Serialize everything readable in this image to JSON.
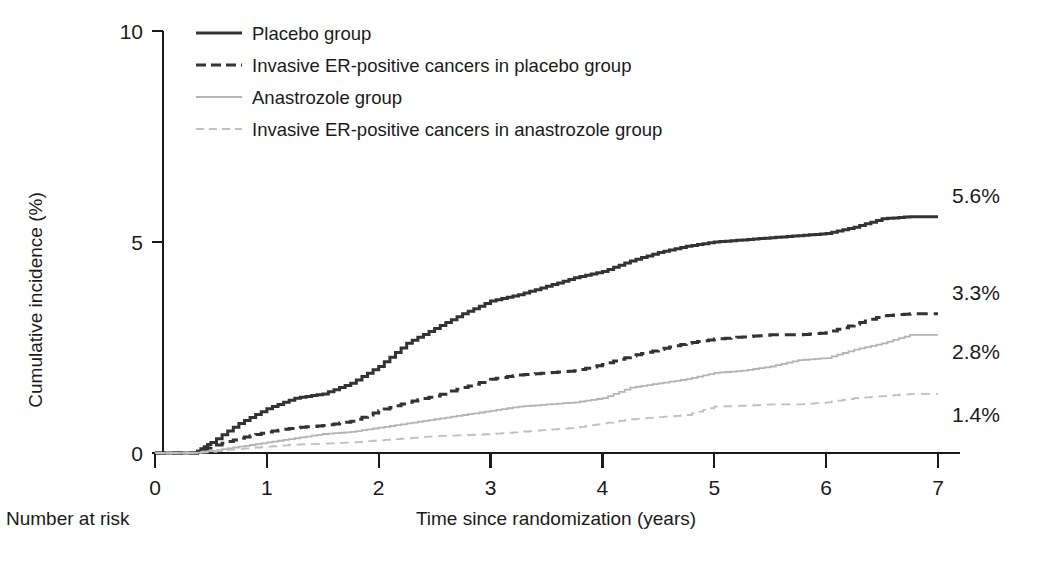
{
  "chart_data": {
    "type": "line",
    "title": "",
    "xlabel": "Time since randomization (years)",
    "ylabel": "Cumulative incidence (%)",
    "xlim": [
      0,
      7
    ],
    "ylim": [
      0,
      10
    ],
    "xticks": [
      "0",
      "1",
      "2",
      "3",
      "4",
      "5",
      "6",
      "7"
    ],
    "yticks": [
      "0",
      "5",
      "10"
    ],
    "grid": false,
    "legend_position": "top-left-inside",
    "x": [
      0,
      0.35,
      0.5,
      0.75,
      1,
      1.25,
      1.5,
      1.75,
      2,
      2.25,
      2.5,
      2.75,
      3,
      3.25,
      3.5,
      3.75,
      4,
      4.25,
      4.5,
      4.75,
      5,
      5.25,
      5.5,
      5.75,
      6,
      6.25,
      6.5,
      6.75,
      7
    ],
    "series": [
      {
        "name": "Placebo group",
        "style": "solid",
        "color": "#333333",
        "end_label": "5.6%",
        "values": [
          0,
          0.0,
          0.25,
          0.7,
          1.05,
          1.3,
          1.4,
          1.65,
          2.05,
          2.6,
          2.95,
          3.3,
          3.6,
          3.75,
          3.95,
          4.15,
          4.3,
          4.55,
          4.75,
          4.9,
          5.0,
          5.05,
          5.1,
          5.15,
          5.2,
          5.35,
          5.55,
          5.6,
          5.6
        ]
      },
      {
        "name": "Invasive ER-positive cancers in placebo group",
        "style": "dashed",
        "color": "#333333",
        "end_label": "3.3%",
        "values": [
          0,
          0.0,
          0.15,
          0.35,
          0.5,
          0.6,
          0.65,
          0.75,
          1.0,
          1.2,
          1.35,
          1.55,
          1.75,
          1.85,
          1.9,
          1.95,
          2.1,
          2.3,
          2.45,
          2.6,
          2.7,
          2.75,
          2.8,
          2.8,
          2.85,
          3.05,
          3.25,
          3.3,
          3.3
        ]
      },
      {
        "name": "Anastrozole group",
        "style": "solid",
        "color": "#b4b4b4",
        "end_label": "2.8%",
        "values": [
          0,
          0.0,
          0.05,
          0.15,
          0.25,
          0.35,
          0.45,
          0.5,
          0.6,
          0.7,
          0.8,
          0.9,
          1.0,
          1.1,
          1.15,
          1.2,
          1.3,
          1.55,
          1.65,
          1.75,
          1.9,
          1.95,
          2.05,
          2.2,
          2.25,
          2.45,
          2.6,
          2.8,
          2.8
        ]
      },
      {
        "name": "Invasive ER-positive cancers in anastrozole group",
        "style": "dashed",
        "color": "#c0c0c0",
        "end_label": "1.4%",
        "values": [
          0,
          0.0,
          0.03,
          0.1,
          0.15,
          0.2,
          0.22,
          0.25,
          0.3,
          0.35,
          0.4,
          0.42,
          0.45,
          0.5,
          0.55,
          0.6,
          0.7,
          0.8,
          0.85,
          0.9,
          1.1,
          1.12,
          1.15,
          1.15,
          1.2,
          1.3,
          1.35,
          1.4,
          1.4
        ]
      }
    ]
  },
  "legend": {
    "items": [
      {
        "label": "Placebo group"
      },
      {
        "label": "Invasive ER-positive cancers in placebo group"
      },
      {
        "label": "Anastrozole group"
      },
      {
        "label": "Invasive ER-positive cancers in anastrozole group"
      }
    ]
  },
  "footer": {
    "risk_table_title": "Number at risk"
  }
}
